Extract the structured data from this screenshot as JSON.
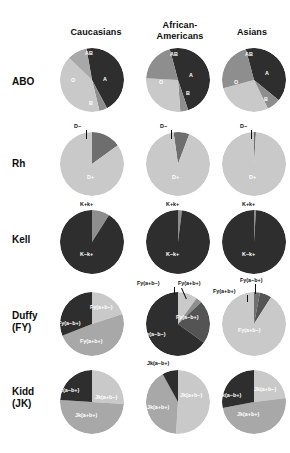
{
  "figure": {
    "title": "",
    "columns": [
      {
        "id": "caucasians",
        "label": "Caucasians"
      },
      {
        "id": "african-americans",
        "label": "African-\nAmericans",
        "line1": "African-",
        "line2": "Americans"
      },
      {
        "id": "asians",
        "label": "Asians"
      }
    ],
    "rows": [
      {
        "id": "abo",
        "label": "ABO",
        "sub": ""
      },
      {
        "id": "rh",
        "label": "Rh",
        "sub": ""
      },
      {
        "id": "kell",
        "label": "Kell",
        "sub": ""
      },
      {
        "id": "duffy",
        "label": "Duffy",
        "sub": "(FY)"
      },
      {
        "id": "kidd",
        "label": "Kidd",
        "sub": "(JK)"
      }
    ]
  },
  "colors": {
    "dark": "#2e2e2e",
    "mid_dark": "#545454",
    "mid": "#8e8e8e",
    "mid_light": "#a8a8a8",
    "light": "#c9c9c9",
    "lighter": "#d8d8d8",
    "text_on_dark": "#ffffff",
    "text_on_light": "#111111"
  },
  "chart_data": [
    {
      "type": "pie",
      "id": "abo-caucasians",
      "title": "ABO — Caucasians",
      "row": "ABO",
      "column": "Caucasians",
      "labels": [
        "O",
        "AB",
        "A",
        "B"
      ],
      "values": [
        45,
        4,
        41,
        10
      ],
      "colors": [
        "#2e2e2e",
        "#8e8e8e",
        "#c9c9c9",
        "#a8a8a8"
      ],
      "label_positions": [
        "inside",
        "inside",
        "inside",
        "inside"
      ],
      "start_angle_deg": 350
    },
    {
      "type": "pie",
      "id": "abo-african-americans",
      "title": "ABO — African-Americans",
      "row": "ABO",
      "column": "African-Americans",
      "labels": [
        "O",
        "AB",
        "A",
        "B"
      ],
      "values": [
        49,
        4,
        27,
        20
      ],
      "colors": [
        "#2e2e2e",
        "#8e8e8e",
        "#c9c9c9",
        "#8e8e8e"
      ],
      "label_positions": [
        "inside",
        "inside",
        "inside",
        "inside"
      ],
      "start_angle_deg": 345
    },
    {
      "type": "pie",
      "id": "abo-asians",
      "title": "ABO — Asians",
      "row": "ABO",
      "column": "Asians",
      "labels": [
        "O",
        "AB",
        "A",
        "B"
      ],
      "values": [
        40,
        7,
        28,
        25
      ],
      "colors": [
        "#2e2e2e",
        "#8e8e8e",
        "#c9c9c9",
        "#8e8e8e"
      ],
      "label_positions": [
        "inside",
        "inside",
        "inside",
        "inside"
      ],
      "start_angle_deg": 345
    },
    {
      "type": "pie",
      "id": "rh-caucasians",
      "title": "Rh — Caucasians",
      "row": "Rh",
      "column": "Caucasians",
      "labels": [
        "D−",
        "D+"
      ],
      "values": [
        15,
        85
      ],
      "colors": [
        "#6e6e6e",
        "#c9c9c9"
      ],
      "label_positions": [
        "outside",
        "inside"
      ],
      "start_angle_deg": 0
    },
    {
      "type": "pie",
      "id": "rh-african-americans",
      "title": "Rh — African-Americans",
      "row": "Rh",
      "column": "African-Americans",
      "labels": [
        "D−",
        "D+"
      ],
      "values": [
        8,
        92
      ],
      "colors": [
        "#6e6e6e",
        "#c9c9c9"
      ],
      "label_positions": [
        "outside",
        "inside"
      ],
      "start_angle_deg": 352
    },
    {
      "type": "pie",
      "id": "rh-asians",
      "title": "Rh — Asians",
      "row": "Rh",
      "column": "Asians",
      "labels": [
        "D−",
        "D+"
      ],
      "values": [
        1,
        99
      ],
      "colors": [
        "#6e6e6e",
        "#c9c9c9"
      ],
      "label_positions": [
        "outside",
        "inside"
      ],
      "start_angle_deg": 0
    },
    {
      "type": "pie",
      "id": "kell-caucasians",
      "title": "Kell — Caucasians",
      "row": "Kell",
      "column": "Caucasians",
      "labels": [
        "K+k+",
        "K−k+"
      ],
      "values": [
        9,
        91
      ],
      "colors": [
        "#8e8e8e",
        "#2e2e2e"
      ],
      "label_positions": [
        "outside",
        "inside"
      ],
      "start_angle_deg": 0
    },
    {
      "type": "pie",
      "id": "kell-african-americans",
      "title": "Kell — African-Americans",
      "row": "Kell",
      "column": "African-Americans",
      "labels": [
        "K+k+",
        "K−k+"
      ],
      "values": [
        2,
        98
      ],
      "colors": [
        "#8e8e8e",
        "#2e2e2e"
      ],
      "label_positions": [
        "outside",
        "inside"
      ],
      "start_angle_deg": 0
    },
    {
      "type": "pie",
      "id": "kell-asians",
      "title": "Kell — Asians",
      "row": "Kell",
      "column": "Asians",
      "labels": [
        "K+k+",
        "K−k+"
      ],
      "values": [
        1,
        99
      ],
      "colors": [
        "#8e8e8e",
        "#2e2e2e"
      ],
      "label_positions": [
        "outside",
        "inside"
      ],
      "start_angle_deg": 0
    },
    {
      "type": "pie",
      "id": "duffy-caucasians",
      "title": "Duffy (FY) — Caucasians",
      "row": "Duffy (FY)",
      "column": "Caucasians",
      "labels": [
        "Fy(a+b−)",
        "Fy(a+b+)",
        "Fy(a−b+)"
      ],
      "values": [
        20,
        49,
        31
      ],
      "colors": [
        "#c9c9c9",
        "#a8a8a8",
        "#2e2e2e"
      ],
      "label_positions": [
        "inside",
        "inside",
        "inside"
      ],
      "start_angle_deg": 0
    },
    {
      "type": "pie",
      "id": "duffy-african-americans",
      "title": "Duffy (FY) — African-Americans",
      "row": "Duffy (FY)",
      "column": "African-Americans",
      "labels": [
        "Fy(a+b−)",
        "Fy(a+b+)",
        "Fy(a−b+)",
        "Fy(a−b−)"
      ],
      "values": [
        10,
        3,
        22,
        65
      ],
      "colors": [
        "#c9c9c9",
        "#8e8e8e",
        "#545454",
        "#2e2e2e"
      ],
      "label_positions": [
        "outside",
        "outside",
        "inside",
        "inside"
      ],
      "start_angle_deg": 0
    },
    {
      "type": "pie",
      "id": "duffy-asians",
      "title": "Duffy (FY) — Asians",
      "row": "Duffy (FY)",
      "column": "Asians",
      "labels": [
        "Fy(a−b+)",
        "Fy(a+b+)",
        "Fy(a+b−)"
      ],
      "values": [
        3,
        6,
        91
      ],
      "colors": [
        "#6e6e6e",
        "#545454",
        "#c9c9c9"
      ],
      "label_positions": [
        "outside",
        "outside",
        "inside"
      ],
      "start_angle_deg": 0
    },
    {
      "type": "pie",
      "id": "kidd-caucasians",
      "title": "Kidd (JK) — Caucasians",
      "row": "Kidd (JK)",
      "column": "Caucasians",
      "labels": [
        "Jk(a+b−)",
        "Jk(a+b+)",
        "Jk(a−b+)"
      ],
      "values": [
        26,
        50,
        24
      ],
      "colors": [
        "#c9c9c9",
        "#a8a8a8",
        "#2e2e2e"
      ],
      "label_positions": [
        "inside",
        "inside",
        "inside"
      ],
      "start_angle_deg": 0
    },
    {
      "type": "pie",
      "id": "kidd-african-americans",
      "title": "Kidd (JK) — African-Americans",
      "row": "Kidd (JK)",
      "column": "African-Americans",
      "labels": [
        "Jk(a+b−)",
        "Jk(a+b+)",
        "Jk(a−b+)"
      ],
      "values": [
        51,
        41,
        8
      ],
      "colors": [
        "#c9c9c9",
        "#a8a8a8",
        "#2e2e2e"
      ],
      "label_positions": [
        "inside",
        "inside",
        "outside"
      ],
      "start_angle_deg": 0
    },
    {
      "type": "pie",
      "id": "kidd-asians",
      "title": "Kidd (JK) — Asians",
      "row": "Kidd (JK)",
      "column": "Asians",
      "labels": [
        "Jk(a+b−)",
        "Jk(a+b+)",
        "Jk(a−b+)"
      ],
      "values": [
        23,
        49,
        28
      ],
      "colors": [
        "#c9c9c9",
        "#a8a8a8",
        "#2e2e2e"
      ],
      "label_positions": [
        "inside",
        "inside",
        "inside"
      ],
      "start_angle_deg": 0
    }
  ],
  "slice_text": {
    "abo": {
      "caucasians": {
        "O": "O",
        "AB": "AB",
        "A": "A",
        "B": "B"
      },
      "african_americans": {
        "O": "O",
        "AB": "AB",
        "A": "A",
        "B": "B"
      },
      "asians": {
        "O": "O",
        "AB": "AB",
        "A": "A",
        "B": "B"
      }
    },
    "rh": {
      "caucasians": {
        "neg": "D−",
        "pos": "D+"
      },
      "african_americans": {
        "neg": "D−",
        "pos": "D+"
      },
      "asians": {
        "neg": "D−",
        "pos": "D+"
      }
    },
    "kell": {
      "caucasians": {
        "kk": "K+k+",
        "Kk": "K−k+"
      },
      "african_americans": {
        "kk": "K+k+",
        "Kk": "K−k+"
      },
      "asians": {
        "kk": "K+k+",
        "Kk": "K−k+"
      }
    },
    "duffy": {
      "caucasians": {
        "apbm": "Fy(a+b−)",
        "apbp": "Fy(a+b+)",
        "ambp": "Fy(a−b+)"
      },
      "african_americans": {
        "apbm": "Fy(a+b−)",
        "apbp": "Fy(a+b+)",
        "ambp": "Fy(a−b+)",
        "ambm": "Fy(a−b−)"
      },
      "asians": {
        "apbm": "Fy(a+b−)",
        "apbp": "Fy(a+b+)",
        "ambp": "Fy(a−b+)"
      }
    },
    "kidd": {
      "caucasians": {
        "apbm": "Jk(a+b−)",
        "apbp": "Jk(a+b+)",
        "ambp": "Jk(a−b+)"
      },
      "african_americans": {
        "apbm": "Jk(a+b−)",
        "apbp": "Jk(a+b+)",
        "ambp": "Jk(a−b+)"
      },
      "asians": {
        "apbm": "Jk(a+b−)",
        "apbp": "Jk(a+b+)",
        "ambp": "Jk(a−b+)"
      }
    }
  }
}
